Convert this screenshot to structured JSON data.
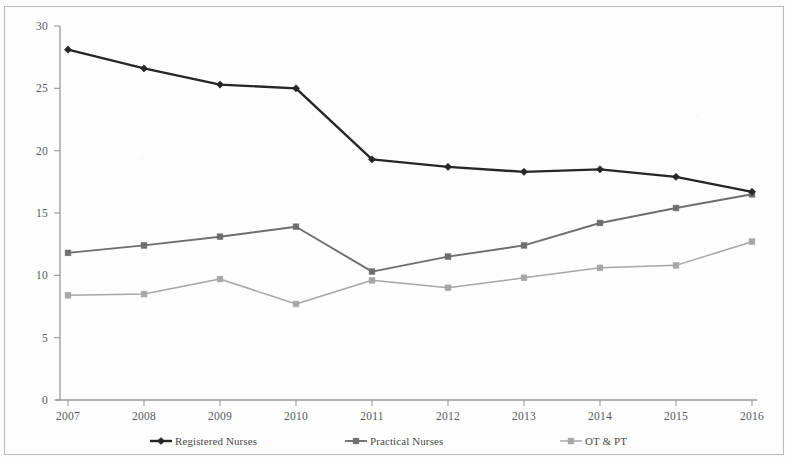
{
  "chart_data": {
    "type": "line",
    "title": "",
    "subtitle": "",
    "xlabel": "",
    "ylabel": "",
    "categories": [
      "2007",
      "2008",
      "2009",
      "2010",
      "2011",
      "2012",
      "2013",
      "2014",
      "2015",
      "2016"
    ],
    "xlim": [
      "2007",
      "2016"
    ],
    "ylim": [
      0,
      30
    ],
    "ytick_labels": [
      "0",
      "5",
      "10",
      "15",
      "20",
      "25",
      "30"
    ],
    "ytick_values": [
      0,
      5,
      10,
      15,
      20,
      25,
      30
    ],
    "ytick_step": 5,
    "grid": false,
    "legend_position": "bottom",
    "series": [
      {
        "name": "Registered Nurses",
        "values": [
          28.1,
          26.6,
          25.3,
          25.0,
          19.3,
          18.7,
          18.3,
          18.5,
          17.9,
          16.7
        ],
        "color": "#262626",
        "marker": "diamond",
        "line_width": 2.4
      },
      {
        "name": "Practical Nurses",
        "values": [
          11.8,
          12.4,
          13.1,
          13.9,
          10.3,
          11.5,
          12.4,
          14.2,
          15.4,
          16.5
        ],
        "color": "#6e6e6e",
        "marker": "square",
        "line_width": 1.9
      },
      {
        "name": "OT & PT",
        "values": [
          8.4,
          8.5,
          9.7,
          7.7,
          9.6,
          9.0,
          9.8,
          10.6,
          10.8,
          12.7
        ],
        "color": "#a6a6a6",
        "marker": "square",
        "line_width": 1.5
      }
    ]
  },
  "legend": {
    "entries": [
      {
        "label": "Registered Nurses"
      },
      {
        "label": "Practical Nurses"
      },
      {
        "label": "OT & PT"
      }
    ]
  },
  "axes": {
    "y_axis_color": "#9a9a9a",
    "x_axis_color": "#9a9a9a",
    "border_color": "#b9b9b9"
  }
}
